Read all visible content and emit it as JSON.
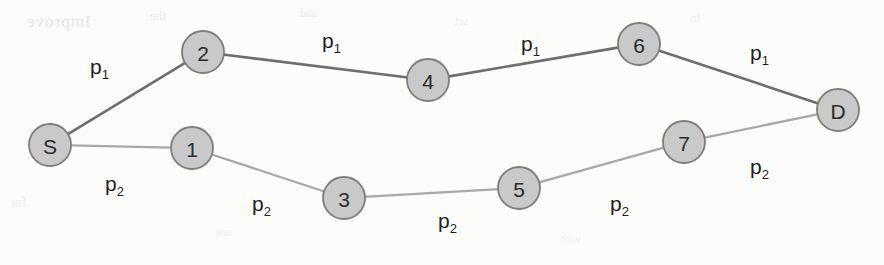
{
  "diagram": {
    "type": "node-link-graph",
    "background_color": "#fcfcfa",
    "node_fill_color": "#c9c9c9",
    "node_stroke_color": "#7d7d7d",
    "path1_edge_color": "#6e6e6e",
    "path2_edge_color": "#a8a8a8",
    "nodes": [
      {
        "id": "S",
        "label": "S",
        "cx": 50,
        "cy": 145,
        "r": 21
      },
      {
        "id": "2",
        "label": "2",
        "cx": 203,
        "cy": 52,
        "r": 21
      },
      {
        "id": "4",
        "label": "4",
        "cx": 428,
        "cy": 80,
        "r": 21
      },
      {
        "id": "6",
        "label": "6",
        "cx": 639,
        "cy": 44,
        "r": 21
      },
      {
        "id": "D",
        "label": "D",
        "cx": 838,
        "cy": 110,
        "r": 21
      },
      {
        "id": "1",
        "label": "1",
        "cx": 192,
        "cy": 148,
        "r": 21
      },
      {
        "id": "3",
        "label": "3",
        "cx": 344,
        "cy": 198,
        "r": 21
      },
      {
        "id": "5",
        "label": "5",
        "cx": 519,
        "cy": 188,
        "r": 21
      },
      {
        "id": "7",
        "label": "7",
        "cx": 684,
        "cy": 142,
        "r": 21
      }
    ],
    "edges": [
      {
        "from": "S",
        "to": "2",
        "path": "p1"
      },
      {
        "from": "2",
        "to": "4",
        "path": "p1"
      },
      {
        "from": "4",
        "to": "6",
        "path": "p1"
      },
      {
        "from": "6",
        "to": "D",
        "path": "p1"
      },
      {
        "from": "S",
        "to": "1",
        "path": "p2"
      },
      {
        "from": "1",
        "to": "3",
        "path": "p2"
      },
      {
        "from": "3",
        "to": "5",
        "path": "p2"
      },
      {
        "from": "5",
        "to": "7",
        "path": "p2"
      },
      {
        "from": "7",
        "to": "D",
        "path": "p2"
      }
    ],
    "edge_labels": [
      {
        "base": "p",
        "sub": "1",
        "x": 90,
        "y": 56,
        "for_edge": "S-2"
      },
      {
        "base": "p",
        "sub": "1",
        "x": 322,
        "y": 30,
        "for_edge": "2-4"
      },
      {
        "base": "p",
        "sub": "1",
        "x": 521,
        "y": 33,
        "for_edge": "4-6"
      },
      {
        "base": "p",
        "sub": "1",
        "x": 750,
        "y": 42,
        "for_edge": "6-D"
      },
      {
        "base": "p",
        "sub": "2",
        "x": 105,
        "y": 173,
        "for_edge": "S-1"
      },
      {
        "base": "p",
        "sub": "2",
        "x": 252,
        "y": 193,
        "for_edge": "1-3"
      },
      {
        "base": "p",
        "sub": "2",
        "x": 438,
        "y": 210,
        "for_edge": "3-5"
      },
      {
        "base": "p",
        "sub": "2",
        "x": 610,
        "y": 193,
        "for_edge": "5-7"
      },
      {
        "base": "p",
        "sub": "2",
        "x": 750,
        "y": 156,
        "for_edge": "7-D"
      }
    ],
    "ghost_text": {
      "a": "Improve",
      "b": "the",
      "c": "and",
      "d": "set",
      "e": "in",
      "f": "for",
      "g": "one",
      "h": "with"
    }
  }
}
